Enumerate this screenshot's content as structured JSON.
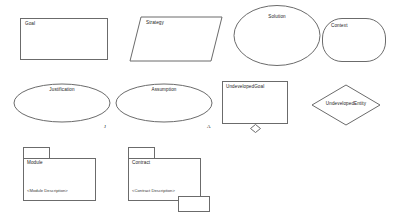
{
  "diagram": {
    "stroke_color": "#6b6b6b",
    "fill_color": "#ffffff",
    "text_color": "#1a1a1a",
    "background": "#ffffff"
  },
  "elements": {
    "goal": {
      "label": "Goal",
      "shape": "rectangle"
    },
    "strategy": {
      "label": "Strategy",
      "shape": "parallelogram"
    },
    "solution": {
      "label": "Solution",
      "shape": "circle"
    },
    "context": {
      "label": "Context",
      "shape": "rounded-rectangle"
    },
    "justification": {
      "label": "Justification",
      "shape": "ellipse",
      "marker": "J"
    },
    "assumption": {
      "label": "Assumption",
      "shape": "ellipse",
      "marker": "A"
    },
    "undeveloped_goal": {
      "label": "UndevelopedGoal",
      "shape": "rectangle-with-diamond",
      "marker": "undeveloped-diamond"
    },
    "undeveloped_entity": {
      "label": "UndevelopedEntity",
      "shape": "diamond"
    },
    "module": {
      "label": "Module",
      "description": "<Module Description>",
      "shape": "package"
    },
    "contract": {
      "label": "Contract",
      "description": "<Contract Description>",
      "shape": "package-with-extension"
    }
  }
}
